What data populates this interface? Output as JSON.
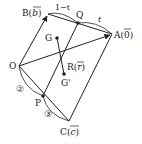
{
  "diagram": {
    "points": {
      "O": {
        "label": "O",
        "x": 19,
        "y": 66
      },
      "B": {
        "label": "B(",
        "vec": "b",
        "close": ")",
        "x": 48,
        "y": 14
      },
      "Q": {
        "label": "Q",
        "x": 78,
        "y": 23
      },
      "A": {
        "label": "A(",
        "vec": "0",
        "close": ")",
        "x": 112,
        "y": 34
      },
      "G": {
        "label": "G",
        "x": 57,
        "y": 38
      },
      "R": {
        "label": "R(",
        "vec": "r",
        "close": ")"
      },
      "G_prime": {
        "label": "G'",
        "x": 64,
        "y": 74
      },
      "P": {
        "label": "P",
        "x": 43,
        "y": 96
      },
      "C": {
        "label": "C(",
        "vec": "c",
        "close": ")",
        "x": 69,
        "y": 121
      }
    },
    "ratios": {
      "BQ": "1−t",
      "QA": "t",
      "OP": "②",
      "PC": "③"
    },
    "colors": {
      "line": "#222222",
      "background": "#ffffff"
    }
  }
}
